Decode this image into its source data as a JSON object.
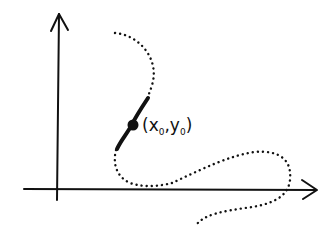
{
  "diagram": {
    "style": "hand-drawn sketch",
    "point_label": {
      "open": "(",
      "x": "x",
      "x_sub": "0",
      "sep": ",",
      "y": "y",
      "y_sub": "0",
      "close": ")"
    },
    "colors": {
      "ink": "#111111",
      "background": "#ffffff"
    },
    "elements": [
      "y-axis with arrow",
      "x-axis with arrow",
      "dotted curve",
      "solid tangent-like segment",
      "highlighted point (x0, y0)"
    ]
  }
}
